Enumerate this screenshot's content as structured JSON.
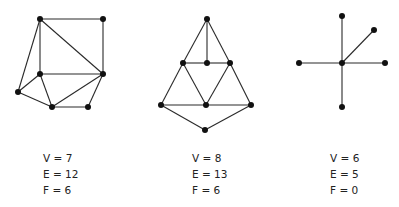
{
  "figure": {
    "graphs": [
      {
        "name": "graph-1",
        "vertices": [
          [
            40,
            19
          ],
          [
            103,
            19
          ],
          [
            40,
            74
          ],
          [
            103,
            74
          ],
          [
            18,
            92
          ],
          [
            52,
            107
          ],
          [
            88,
            107
          ]
        ],
        "edges": [
          [
            0,
            1
          ],
          [
            0,
            3
          ],
          [
            1,
            3
          ],
          [
            0,
            2
          ],
          [
            0,
            4
          ],
          [
            2,
            3
          ],
          [
            2,
            4
          ],
          [
            2,
            5
          ],
          [
            4,
            5
          ],
          [
            5,
            3
          ],
          [
            5,
            6
          ],
          [
            6,
            3
          ]
        ],
        "stats": {
          "v": "V = 7",
          "e": "E = 12",
          "f": "F = 6"
        }
      },
      {
        "name": "graph-2",
        "vertices": [
          [
            207,
            19
          ],
          [
            183,
            63
          ],
          [
            207,
            63
          ],
          [
            230,
            63
          ],
          [
            161,
            105
          ],
          [
            206,
            105
          ],
          [
            251,
            105
          ],
          [
            205,
            130
          ]
        ],
        "edges": [
          [
            0,
            1
          ],
          [
            0,
            2
          ],
          [
            0,
            3
          ],
          [
            1,
            2
          ],
          [
            2,
            3
          ],
          [
            1,
            4
          ],
          [
            1,
            5
          ],
          [
            3,
            5
          ],
          [
            3,
            6
          ],
          [
            4,
            5
          ],
          [
            5,
            6
          ],
          [
            4,
            7
          ],
          [
            6,
            7
          ]
        ],
        "stats": {
          "v": "V = 8",
          "e": "E = 13",
          "f": "F = 6"
        }
      },
      {
        "name": "graph-3",
        "vertices": [
          [
            342,
            63
          ],
          [
            342,
            16
          ],
          [
            374,
            30
          ],
          [
            299,
            63
          ],
          [
            385,
            63
          ],
          [
            342,
            107
          ]
        ],
        "edges": [
          [
            0,
            1
          ],
          [
            0,
            2
          ],
          [
            0,
            3
          ],
          [
            0,
            4
          ],
          [
            0,
            5
          ]
        ],
        "stats": {
          "v": "V = 6",
          "e": "E = 5",
          "f": "F = 0"
        }
      }
    ]
  }
}
